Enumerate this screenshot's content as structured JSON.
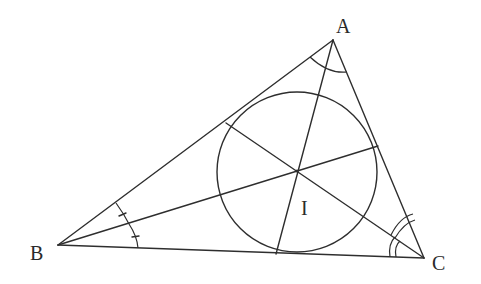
{
  "diagram": {
    "type": "geometry",
    "labels": {
      "A": "A",
      "B": "B",
      "C": "C",
      "I": "I"
    },
    "points": {
      "A": [
        333,
        40
      ],
      "B": [
        58,
        245
      ],
      "C": [
        424,
        258
      ],
      "I": [
        297,
        171
      ]
    },
    "incircle": {
      "cx": 297,
      "cy": 172,
      "r": 80
    },
    "bisector_feet": {
      "from_A_on_BC": [
        276,
        254
      ],
      "from_B_on_AC": [
        378,
        146
      ],
      "from_C_on_AB": [
        226,
        123
      ]
    },
    "angle_marks": {
      "A": "single arc",
      "B": "single arc split by bisector with one tick on each half",
      "C": "double arc on each half"
    },
    "colors": {
      "stroke": "#2e2e2e",
      "background": "#ffffff"
    }
  }
}
